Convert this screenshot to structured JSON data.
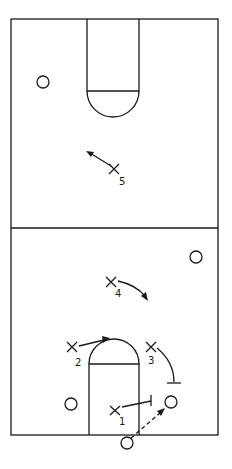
{
  "diagram": {
    "type": "basketball-play",
    "court": {
      "left": 11,
      "right": 218,
      "top": 19,
      "half_line": 228,
      "bottom": 435,
      "line_color": "#1a1a1a"
    },
    "offense": [
      {
        "label": "1",
        "x": 117,
        "y": 410
      },
      {
        "label": "2",
        "x": 72,
        "y": 347
      },
      {
        "label": "3",
        "x": 151,
        "y": 347
      },
      {
        "label": "4",
        "x": 111,
        "y": 282
      },
      {
        "label": "5",
        "x": 114,
        "y": 169
      }
    ],
    "defense_circles": [
      {
        "x": 43,
        "y": 82
      },
      {
        "x": 196,
        "y": 257
      },
      {
        "x": 71,
        "y": 404
      },
      {
        "x": 171,
        "y": 402
      },
      {
        "x": 127,
        "y": 443
      }
    ]
  }
}
